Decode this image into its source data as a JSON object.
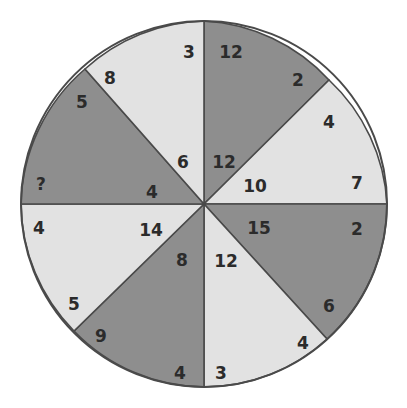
{
  "puzzle": {
    "type": "number-wheel",
    "center": [
      204,
      204
    ],
    "radius": 183,
    "colors": {
      "dark": "#8e8e8e",
      "light": "#e2e2e2",
      "outline": "#4a4a4a",
      "text": "#2b2b2b"
    },
    "segments": [
      {
        "position": "top-right",
        "shade": "dark",
        "edge": [
          [
            204,
            21
          ],
          [
            329,
            80
          ]
        ],
        "outer_a": {
          "value": "12",
          "x": 231,
          "y": 52
        },
        "outer_b": {
          "value": "2",
          "x": 298,
          "y": 80
        },
        "inner": {
          "value": "12",
          "x": 224,
          "y": 162
        }
      },
      {
        "position": "right-upper",
        "shade": "light",
        "edge": [
          [
            329,
            80
          ],
          [
            387,
            204
          ]
        ],
        "outer_a": {
          "value": "4",
          "x": 329,
          "y": 122
        },
        "outer_b": {
          "value": "7",
          "x": 357,
          "y": 183
        },
        "inner": {
          "value": "10",
          "x": 255,
          "y": 186
        }
      },
      {
        "position": "right-lower",
        "shade": "dark",
        "edge": [
          [
            387,
            204
          ],
          [
            327,
            339
          ]
        ],
        "outer_a": {
          "value": "2",
          "x": 357,
          "y": 229
        },
        "outer_b": {
          "value": "6",
          "x": 329,
          "y": 306
        },
        "inner": {
          "value": "15",
          "x": 259,
          "y": 228
        }
      },
      {
        "position": "bottom-right",
        "shade": "light",
        "edge": [
          [
            327,
            339
          ],
          [
            204,
            387
          ]
        ],
        "outer_a": {
          "value": "4",
          "x": 303,
          "y": 343
        },
        "outer_b": {
          "value": "3",
          "x": 221,
          "y": 373
        },
        "inner": {
          "value": "12",
          "x": 226,
          "y": 261
        }
      },
      {
        "position": "bottom-left",
        "shade": "dark",
        "edge": [
          [
            204,
            387
          ],
          [
            74,
            331
          ]
        ],
        "outer_a": {
          "value": "4",
          "x": 180,
          "y": 373
        },
        "outer_b": {
          "value": "9",
          "x": 101,
          "y": 336
        },
        "inner": {
          "value": "8",
          "x": 182,
          "y": 260
        }
      },
      {
        "position": "left-lower",
        "shade": "light",
        "edge": [
          [
            74,
            331
          ],
          [
            21,
            204
          ]
        ],
        "outer_a": {
          "value": "5",
          "x": 74,
          "y": 304
        },
        "outer_b": {
          "value": "4",
          "x": 39,
          "y": 228
        },
        "inner": {
          "value": "14",
          "x": 151,
          "y": 230
        }
      },
      {
        "position": "left-upper",
        "shade": "dark",
        "edge": [
          [
            21,
            204
          ],
          [
            85,
            69
          ]
        ],
        "outer_a": {
          "value": "?",
          "x": 41,
          "y": 184
        },
        "outer_b": {
          "value": "5",
          "x": 82,
          "y": 102
        },
        "inner": {
          "value": "4",
          "x": 152,
          "y": 192
        }
      },
      {
        "position": "top-left",
        "shade": "light",
        "edge": [
          [
            85,
            69
          ],
          [
            204,
            21
          ]
        ],
        "outer_a": {
          "value": "8",
          "x": 110,
          "y": 78
        },
        "outer_b": {
          "value": "3",
          "x": 189,
          "y": 52
        },
        "inner": {
          "value": "6",
          "x": 183,
          "y": 162
        }
      }
    ]
  }
}
